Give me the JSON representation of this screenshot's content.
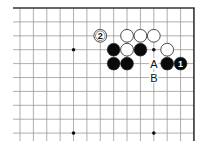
{
  "diagram": {
    "type": "go-board-fragment",
    "corner": "top-right",
    "grid": {
      "cols": 14,
      "rows": 10,
      "origin_x": 20,
      "origin_y": 8,
      "spacing_x": 13.38,
      "spacing_y": 13.9,
      "line_color": "#9a9a9a",
      "edge_color": "#333333",
      "left_overhang": 7,
      "bottom_overhang": 8
    },
    "star_points": [
      {
        "col": 4,
        "row": 3
      },
      {
        "col": 10,
        "row": 3
      },
      {
        "col": 4,
        "row": 9
      },
      {
        "col": 10,
        "row": 9
      }
    ],
    "stones": [
      {
        "col": 6,
        "row": 2,
        "color": "white",
        "label": "2"
      },
      {
        "col": 8,
        "row": 2,
        "color": "white",
        "label": ""
      },
      {
        "col": 9,
        "row": 2,
        "color": "white",
        "label": ""
      },
      {
        "col": 10,
        "row": 2,
        "color": "white",
        "label": ""
      },
      {
        "col": 7,
        "row": 3,
        "color": "black",
        "label": ""
      },
      {
        "col": 8,
        "row": 3,
        "color": "white",
        "label": ""
      },
      {
        "col": 9,
        "row": 3,
        "color": "black",
        "label": ""
      },
      {
        "col": 11,
        "row": 3,
        "color": "white",
        "label": ""
      },
      {
        "col": 7,
        "row": 4,
        "color": "black",
        "label": ""
      },
      {
        "col": 8,
        "row": 4,
        "color": "black",
        "label": ""
      },
      {
        "col": 11,
        "row": 4,
        "color": "black",
        "label": ""
      },
      {
        "col": 12,
        "row": 4,
        "color": "black",
        "label": "1"
      }
    ],
    "marks": [
      {
        "col": 10,
        "row": 4,
        "text": "A"
      },
      {
        "col": 10,
        "row": 5,
        "text": "B"
      }
    ],
    "colors": {
      "black_stone": "#0a0a0a",
      "white_stone": "#ffffff",
      "stone_outline": "#222222",
      "background": "#ffffff"
    }
  }
}
